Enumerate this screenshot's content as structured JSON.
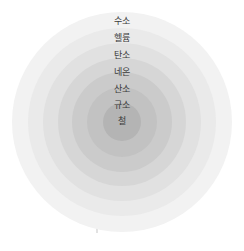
{
  "diagram": {
    "type": "concentric-shells",
    "background_color": "#ffffff",
    "center": {
      "x": 122,
      "y": 122
    },
    "label_color": "#3a3a3a",
    "shells": [
      {
        "label": "수소",
        "element": "hydrogen",
        "radius": 110,
        "color": "#f2f2f2",
        "label_y": 17
      },
      {
        "label": "헬륨",
        "element": "helium",
        "radius": 94,
        "color": "#eaeaea",
        "label_y": 34
      },
      {
        "label": "탄소",
        "element": "carbon",
        "radius": 79,
        "color": "#e1e1e1",
        "label_y": 51
      },
      {
        "label": "네온",
        "element": "neon",
        "radius": 64,
        "color": "#d6d6d6",
        "label_y": 68
      },
      {
        "label": "산소",
        "element": "oxygen",
        "radius": 50,
        "color": "#cbcbcb",
        "label_y": 85
      },
      {
        "label": "규소",
        "element": "silicon",
        "radius": 35,
        "color": "#c2c2c2",
        "label_y": 101
      },
      {
        "label": "철",
        "element": "iron",
        "radius": 19,
        "color": "#b4b4b4",
        "label_y": 117
      }
    ]
  }
}
